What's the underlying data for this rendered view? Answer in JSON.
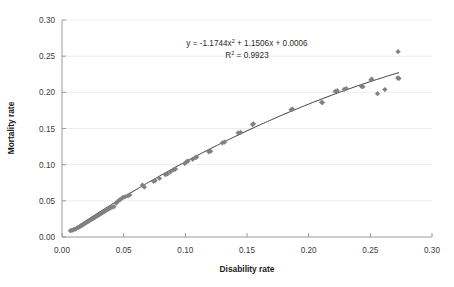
{
  "chart_data": {
    "type": "scatter",
    "title": "",
    "xlabel": "Disability rate",
    "ylabel": "Mortality rate",
    "xlim": [
      0.0,
      0.3
    ],
    "ylim": [
      0.0,
      0.3
    ],
    "xticks": [
      "0.00",
      "0.05",
      "0.10",
      "0.15",
      "0.20",
      "0.25",
      "0.30"
    ],
    "yticks": [
      "0.00",
      "0.05",
      "0.10",
      "0.15",
      "0.20",
      "0.25",
      "0.30"
    ],
    "xtick_values": [
      0.0,
      0.05,
      0.1,
      0.15,
      0.2,
      0.25,
      0.3
    ],
    "ytick_values": [
      0.0,
      0.05,
      0.1,
      0.15,
      0.2,
      0.25,
      0.3
    ],
    "grid": true,
    "grid_axis": "y",
    "legend": false,
    "legend_position": "none",
    "marker": "diamond",
    "marker_color": "#808080",
    "trendline": {
      "type": "polynomial",
      "order": 2,
      "color": "#3d3d3d",
      "coefficients": {
        "a": -1.1744,
        "b": 1.1506,
        "c": 0.0006
      },
      "equation_text": "y = -1.1744x",
      "equation_exponent": "2",
      "equation_rest": " + 1.1506x + 0.0006",
      "r2_label": "R",
      "r2_exponent": "2",
      "r2_value": " = 0.9923"
    },
    "points": [
      [
        0.0068,
        0.0088
      ],
      [
        0.008,
        0.0092
      ],
      [
        0.0092,
        0.01
      ],
      [
        0.0105,
        0.0108
      ],
      [
        0.0118,
        0.0118
      ],
      [
        0.013,
        0.013
      ],
      [
        0.0142,
        0.014
      ],
      [
        0.0152,
        0.0152
      ],
      [
        0.0163,
        0.0162
      ],
      [
        0.0175,
        0.0176
      ],
      [
        0.0186,
        0.0188
      ],
      [
        0.0198,
        0.02
      ],
      [
        0.021,
        0.0212
      ],
      [
        0.0222,
        0.0224
      ],
      [
        0.0234,
        0.0238
      ],
      [
        0.0246,
        0.025
      ],
      [
        0.0258,
        0.0262
      ],
      [
        0.027,
        0.0276
      ],
      [
        0.0282,
        0.0288
      ],
      [
        0.0294,
        0.03
      ],
      [
        0.0306,
        0.0312
      ],
      [
        0.0318,
        0.0326
      ],
      [
        0.033,
        0.0338
      ],
      [
        0.0342,
        0.035
      ],
      [
        0.0355,
        0.0364
      ],
      [
        0.0368,
        0.0378
      ],
      [
        0.038,
        0.0388
      ],
      [
        0.0392,
        0.0404
      ],
      [
        0.0404,
        0.0412
      ],
      [
        0.042,
        0.0418
      ],
      [
        0.0438,
        0.0468
      ],
      [
        0.0452,
        0.0492
      ],
      [
        0.0468,
        0.0512
      ],
      [
        0.048,
        0.0528
      ],
      [
        0.0495,
        0.0548
      ],
      [
        0.0512,
        0.0556
      ],
      [
        0.0535,
        0.057
      ],
      [
        0.055,
        0.0582
      ],
      [
        0.0652,
        0.0718
      ],
      [
        0.0668,
        0.069
      ],
      [
        0.0742,
        0.0768
      ],
      [
        0.0755,
        0.0778
      ],
      [
        0.079,
        0.081
      ],
      [
        0.0838,
        0.0862
      ],
      [
        0.0855,
        0.0872
      ],
      [
        0.088,
        0.0902
      ],
      [
        0.0905,
        0.0928
      ],
      [
        0.092,
        0.094
      ],
      [
        0.0995,
        0.1015
      ],
      [
        0.101,
        0.1042
      ],
      [
        0.1022,
        0.105
      ],
      [
        0.106,
        0.1075
      ],
      [
        0.1082,
        0.1098
      ],
      [
        0.1092,
        0.1105
      ],
      [
        0.119,
        0.1178
      ],
      [
        0.1205,
        0.1185
      ],
      [
        0.13,
        0.13
      ],
      [
        0.1318,
        0.1312
      ],
      [
        0.1428,
        0.1438
      ],
      [
        0.1448,
        0.1445
      ],
      [
        0.1545,
        0.1555
      ],
      [
        0.1552,
        0.1565
      ],
      [
        0.1858,
        0.176
      ],
      [
        0.1868,
        0.1768
      ],
      [
        0.2105,
        0.1862
      ],
      [
        0.2112,
        0.1858
      ],
      [
        0.2215,
        0.2012
      ],
      [
        0.2232,
        0.2022
      ],
      [
        0.2288,
        0.2042
      ],
      [
        0.2305,
        0.2052
      ],
      [
        0.2428,
        0.2082
      ],
      [
        0.244,
        0.2078
      ],
      [
        0.2505,
        0.2172
      ],
      [
        0.2512,
        0.2182
      ],
      [
        0.2558,
        0.1982
      ],
      [
        0.2618,
        0.2038
      ],
      [
        0.2725,
        0.2562
      ],
      [
        0.2722,
        0.2198
      ],
      [
        0.2732,
        0.2192
      ]
    ]
  },
  "annotations": {
    "equation_line": "y = -1.1744x 2 + 1.1506x + 0.0006",
    "r2_line": "R 2 = 0.9923"
  }
}
